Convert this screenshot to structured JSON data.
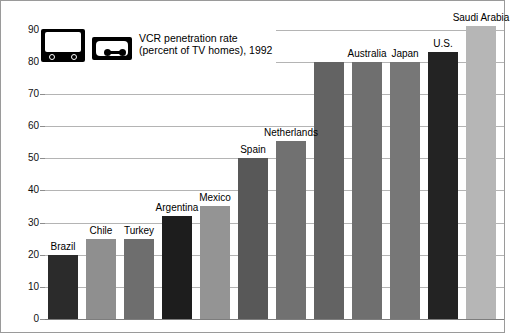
{
  "legend": {
    "tv_icon": "television-icon",
    "vcr_icon": "vcr-cassette-icon",
    "title_line1": "VCR penetration rate",
    "title_line2": "(percent of TV homes), 1992"
  },
  "chart_data": {
    "type": "bar",
    "xlabel": "",
    "ylabel": "",
    "ylim": [
      0,
      90
    ],
    "ytick_step": 10,
    "yticks": [
      "90",
      "80",
      "70",
      "60",
      "50",
      "40",
      "30",
      "20",
      "10",
      "0"
    ],
    "grid": true,
    "legend_position": "top-left-inset",
    "categories": [
      "Brazil",
      "Chile",
      "Turkey",
      "Argentina",
      "Mexico",
      "Spain",
      "Netherlands",
      "",
      "Australia",
      "Japan",
      "U.S.",
      "Saudi Arabia"
    ],
    "values": [
      20,
      25,
      25,
      32,
      35,
      50,
      55.5,
      80,
      80,
      80,
      83,
      91
    ],
    "bar_colors": [
      "#2b2b2b",
      "#8f8f8f",
      "#6e6e6e",
      "#1d1d1d",
      "#949494",
      "#585858",
      "#717171",
      "#636363",
      "#6f6f6f",
      "#777777",
      "#232323",
      "#b6b6b6"
    ],
    "labels": [
      {
        "text": "Brazil",
        "value": 20
      },
      {
        "text": "Chile",
        "value": 25
      },
      {
        "text": "Turkey",
        "value": 25
      },
      {
        "text": "Argentina",
        "value": 32
      },
      {
        "text": "Mexico",
        "value": 35
      },
      {
        "text": "Spain",
        "value": 50
      },
      {
        "text": "Netherlands",
        "value": 55.5
      },
      {
        "text": "",
        "value": 80
      },
      {
        "text": "Australia",
        "value": 80
      },
      {
        "text": "Japan",
        "value": 80
      },
      {
        "text": "U.S.",
        "value": 83
      },
      {
        "text": "Saudi Arabia",
        "value": 91
      }
    ]
  }
}
